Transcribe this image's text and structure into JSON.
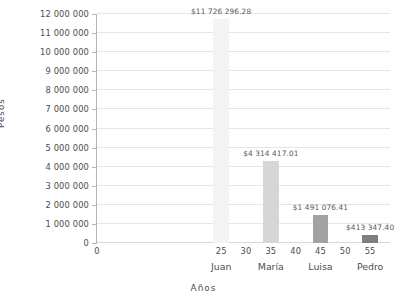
{
  "chart_data": {
    "type": "bar",
    "title": "",
    "xlabel": "Años",
    "ylabel": "Pesos",
    "grid": true,
    "legend": "none",
    "x": [
      25,
      35,
      45,
      55
    ],
    "categories": [
      "Juan",
      "María",
      "Luisa",
      "Pedro"
    ],
    "values": [
      11726296.28,
      4314417.01,
      1491076.41,
      413347.4
    ],
    "data_labels": [
      "$11 726 296.28",
      "$4 314 417.01",
      "$1 491 076.41",
      "$413 347.40"
    ],
    "bar_colors": [
      "#f4f4f4",
      "#d6d6d6",
      "#a2a2a2",
      "#7f7f7f"
    ],
    "bar_width_years": 3.2,
    "xlim": [
      0,
      59
    ],
    "ylim": [
      0,
      12000000
    ],
    "x_ticks": [
      0,
      25,
      30,
      35,
      40,
      45,
      50,
      55
    ],
    "x_tick_labels": [
      "0",
      "25",
      "30",
      "35",
      "40",
      "45",
      "50",
      "55"
    ],
    "y_ticks": [
      0,
      1000000,
      2000000,
      3000000,
      4000000,
      5000000,
      6000000,
      7000000,
      8000000,
      9000000,
      10000000,
      11000000,
      12000000
    ],
    "y_tick_labels": [
      "0",
      "1 000 000",
      "2 000 000",
      "3 000 000",
      "4 000 000",
      "5 000 000",
      "6 000 000",
      "7 000 000",
      "8 000 000",
      "9 000 000",
      "10 000 000",
      "11 000 000",
      "12 000 000"
    ],
    "axis_color": "#b5b5b5",
    "grid_color": "#e6e6e6",
    "text_color": "#4d4d4f",
    "background": "#ffffff"
  }
}
